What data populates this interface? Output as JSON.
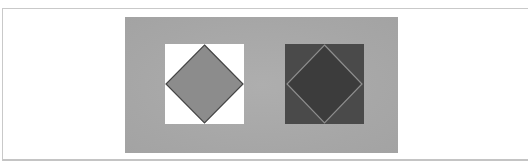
{
  "figure": {
    "colors": {
      "page_background": "#ffffff",
      "frame_border": "#c9c9c9",
      "panel_background": "#a9a9a9"
    },
    "left_square": {
      "background": "#ffffff",
      "diamond_fill": "#8c8c8c",
      "diamond_stroke": "#444444"
    },
    "right_square": {
      "background": "#4a4a4a",
      "diamond_fill": "#3c3c3c",
      "diamond_stroke": "#8e8e8e"
    }
  }
}
